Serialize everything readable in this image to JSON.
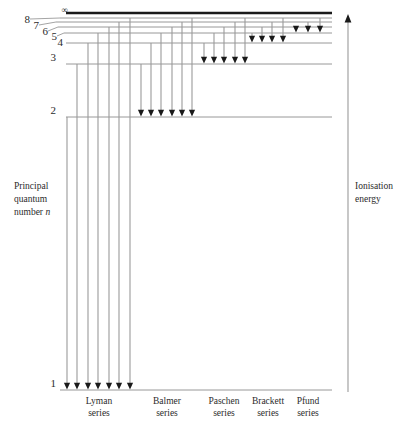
{
  "figure": {
    "type": "energy-level-diagram",
    "title_left": {
      "line1": "Principal",
      "line2": "quantum",
      "line3": "number",
      "symbol": "n"
    },
    "title_right": {
      "line1": "Ionisation",
      "line2": "energy"
    }
  },
  "levels": [
    {
      "label": "∞",
      "y": 13,
      "thick": true,
      "x_start": 66,
      "x_end": 332,
      "leader": false
    },
    {
      "label": "8",
      "y": 18,
      "thick": false,
      "x_start": 60,
      "x_end": 332,
      "leader": true,
      "label_x": 22,
      "label_y": 22
    },
    {
      "label": "7",
      "y": 22,
      "thick": false,
      "x_start": 56,
      "x_end": 332,
      "leader": true,
      "label_x": 31,
      "label_y": 28
    },
    {
      "label": "6",
      "y": 27,
      "thick": false,
      "x_start": 58,
      "x_end": 332,
      "leader": true,
      "label_x": 40,
      "label_y": 34
    },
    {
      "label": "5",
      "y": 33,
      "thick": false,
      "x_start": 64,
      "x_end": 332,
      "leader": true,
      "label_x": 49,
      "label_y": 39
    },
    {
      "label": "4",
      "y": 43,
      "thick": false,
      "x_start": 66,
      "x_end": 332,
      "leader": false,
      "label_x": 55,
      "label_y": 45
    },
    {
      "label": "3",
      "y": 64,
      "thick": false,
      "x_start": 66,
      "x_end": 332,
      "leader": false,
      "label_x": 48,
      "label_y": 60
    },
    {
      "label": "2",
      "y": 117,
      "thick": false,
      "x_start": 66,
      "x_end": 332,
      "leader": false,
      "label_x": 48,
      "label_y": 113
    },
    {
      "label": "1",
      "y": 390,
      "thick": false,
      "x_start": 60,
      "x_end": 332,
      "leader": false,
      "label_x": 48,
      "label_y": 386
    }
  ],
  "chart_data": {
    "type": "line",
    "xlabel": "",
    "ylabel": "Principal quantum number n",
    "grid": false,
    "legend": "none",
    "level_labels": [
      "1",
      "2",
      "3",
      "4",
      "5",
      "6",
      "7",
      "8",
      "∞"
    ],
    "level_y_px": [
      390,
      117,
      64,
      43,
      33,
      27,
      22,
      18,
      13
    ],
    "series": [
      {
        "name": "Lyman series",
        "lower_level": 1,
        "target_y": 390,
        "arrow_count": 7,
        "from_levels": [
          2,
          3,
          4,
          5,
          6,
          7,
          8
        ],
        "x": [
          67,
          77,
          88,
          98,
          109,
          119,
          130
        ],
        "from_y": [
          117,
          64,
          43,
          33,
          27,
          22,
          18
        ],
        "label_x": 99,
        "label_y": 396
      },
      {
        "name": "Balmer series",
        "lower_level": 2,
        "target_y": 117,
        "arrow_count": 6,
        "from_levels": [
          3,
          4,
          5,
          6,
          7,
          8
        ],
        "x": [
          141,
          151,
          161,
          172,
          182,
          192
        ],
        "from_y": [
          64,
          43,
          33,
          27,
          22,
          18
        ],
        "label_x": 167,
        "label_y": 396
      },
      {
        "name": "Paschen series",
        "lower_level": 3,
        "target_y": 64,
        "arrow_count": 5,
        "from_levels": [
          4,
          5,
          6,
          7,
          8
        ],
        "x": [
          204,
          214,
          224,
          235,
          245
        ],
        "from_y": [
          43,
          33,
          27,
          22,
          18
        ],
        "label_x": 224,
        "label_y": 396
      },
      {
        "name": "Brackett series",
        "lower_level": 4,
        "target_y": 43,
        "arrow_count": 4,
        "from_levels": [
          5,
          6,
          7,
          8
        ],
        "x": [
          252,
          262,
          272,
          283
        ],
        "from_y": [
          33,
          27,
          22,
          18
        ],
        "label_x": 268,
        "label_y": 396
      },
      {
        "name": "Pfund series",
        "lower_level": 5,
        "target_y": 33,
        "arrow_count": 3,
        "from_levels": [
          6,
          7,
          8
        ],
        "x": [
          296,
          308,
          320
        ],
        "from_y": [
          27,
          22,
          18
        ],
        "label_x": 308,
        "label_y": 396
      }
    ],
    "ionisation_arrow": {
      "x": 348,
      "y_top": 14,
      "y_bottom": 392,
      "direction": "up",
      "label": "Ionisation energy"
    }
  },
  "series_labels": [
    {
      "name": "Lyman",
      "second": "series",
      "x": 99,
      "y": 395
    },
    {
      "name": "Balmer",
      "second": "series",
      "x": 167,
      "y": 395
    },
    {
      "name": "Paschen",
      "second": "series",
      "x": 224,
      "y": 395
    },
    {
      "name": "Brackett",
      "second": "series",
      "x": 268,
      "y": 395
    },
    {
      "name": "Pfund",
      "second": "series",
      "x": 308,
      "y": 395
    }
  ],
  "colors": {
    "level_line": "#8d8d8d",
    "infinity_line": "#1a1a1a",
    "transition_line": "#9a9a9a",
    "arrow_head": "#1a1a1a",
    "text": "#2b2b2b",
    "background": "#ffffff"
  }
}
